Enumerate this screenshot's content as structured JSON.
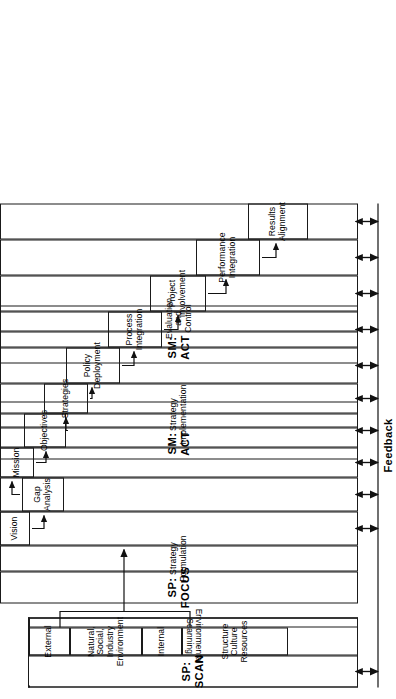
{
  "diagram": {
    "feedback_label": "Feedback",
    "orientation": "rotated-90",
    "line_color": "#1a1a1a",
    "background": "#ffffff"
  },
  "phases": [
    {
      "id": "sp-scan",
      "name": "SP: SCAN",
      "function": "Environmental Scanning"
    },
    {
      "id": "sp-focus",
      "name": "SP: FOCUS",
      "function": "Strategy Formulation"
    },
    {
      "id": "sm-act",
      "name": "SM: ACT",
      "function": "Strategy Implementation"
    },
    {
      "id": "sm-act-2",
      "name": "SM: ACT",
      "function": "Evaluation\nand Control"
    }
  ],
  "scan": {
    "phase_label": "SP: SCAN",
    "function_label": "Environmental Scanning",
    "categories": [
      {
        "label": "External"
      },
      {
        "label": "Natural,\nSocial,\nIndustry\nEnvironment"
      },
      {
        "label": "Internal"
      },
      {
        "label": "Structure\nCulture\nResources"
      }
    ]
  },
  "steps": [
    {
      "id": "vision",
      "label": "Vision",
      "phase": "sp-focus"
    },
    {
      "id": "gap-analysis",
      "label": "Gap\nAnalysis",
      "phase": "sp-focus"
    },
    {
      "id": "mission",
      "label": "Mission",
      "phase": "sp-focus"
    },
    {
      "id": "objectives",
      "label": "Objectives",
      "phase": "sp-focus"
    },
    {
      "id": "strategies",
      "label": "Strategies",
      "phase": "sp-focus"
    },
    {
      "id": "policy-deployment",
      "label": "Policy\nDeployment",
      "phase": "sp-focus"
    },
    {
      "id": "process-integration",
      "label": "Process\nIntegration",
      "phase": "sm-act"
    },
    {
      "id": "project-involvement",
      "label": "Project\nInvolvement",
      "phase": "sm-act"
    },
    {
      "id": "performance-integration",
      "label": "Performance\nIntegration",
      "phase": "sm-act"
    },
    {
      "id": "results-alignment",
      "label": "Results\nAlignment",
      "phase": "sm-act-2"
    }
  ],
  "feedback": {
    "label": "Feedback",
    "arrow_count": 11,
    "arrow_style": "double-headed"
  }
}
